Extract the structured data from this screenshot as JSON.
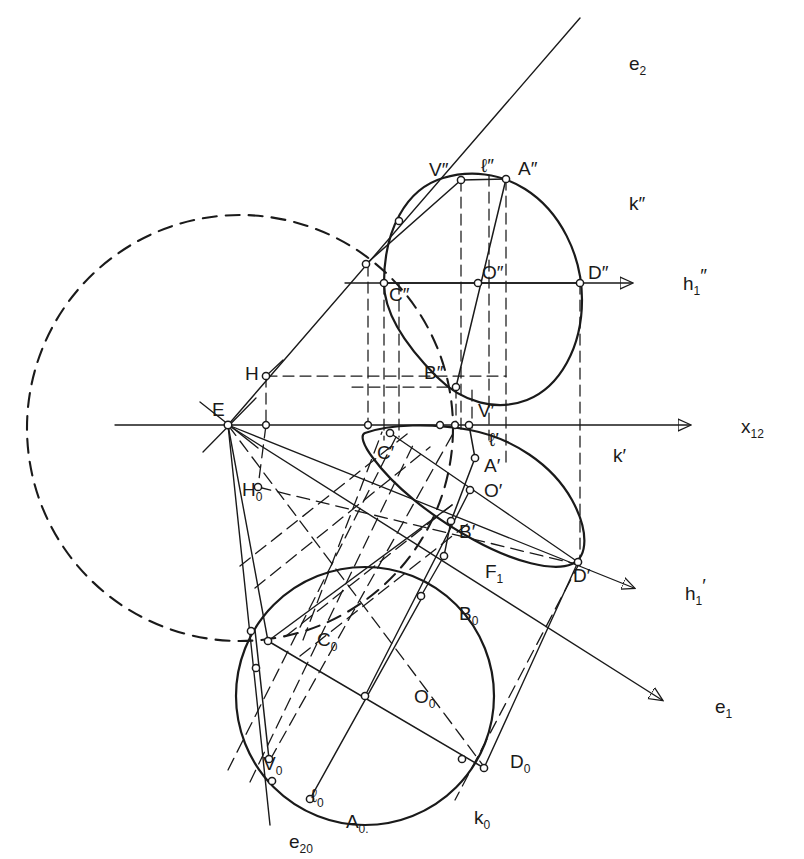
{
  "figure": {
    "background": "#ffffff",
    "ink": "#1a1a1a",
    "width": 804,
    "height": 859
  },
  "axes": [
    {
      "id": "x12",
      "label": "x",
      "sub": "12",
      "label_x": 704,
      "label_y": 426,
      "style": "solid-arrow"
    },
    {
      "id": "h1dd",
      "label": "h",
      "sub": "1",
      "sup": "″",
      "label_x": 646,
      "label_y": 283,
      "style": "solid-arrow"
    },
    {
      "id": "h1d",
      "label": "h",
      "sub": "1",
      "sup": "′",
      "label_x": 648,
      "label_y": 594,
      "style": "solid-arrow"
    },
    {
      "id": "e2",
      "label": "e",
      "sub": "2",
      "label_x": 592,
      "label_y": 64,
      "style": "solid"
    },
    {
      "id": "e1",
      "label": "e",
      "sub": "1",
      "label_x": 678,
      "label_y": 707,
      "style": "solid-arrow"
    },
    {
      "id": "e20",
      "label": "e",
      "sub": "20",
      "label_x": 258,
      "label_y": 842,
      "style": "solid"
    }
  ],
  "curves": [
    {
      "id": "k2",
      "label": "k",
      "sup": "″",
      "label_x": 592,
      "label_y": 204,
      "kind": "ellipse",
      "stroke": "solid"
    },
    {
      "id": "k1",
      "label": "k",
      "sup": "′",
      "label_x": 576,
      "label_y": 456,
      "kind": "ellipse",
      "stroke": "solid"
    },
    {
      "id": "k0",
      "label": "k",
      "sub": "0",
      "label_x": 437,
      "label_y": 818,
      "kind": "circle",
      "stroke": "solid"
    },
    {
      "id": "aux",
      "label": "",
      "kind": "circle",
      "stroke": "dashed"
    }
  ],
  "points": [
    {
      "name": "V″",
      "x": 461,
      "y": 180,
      "label_x": 429,
      "label_y": 170
    },
    {
      "name": "ℓ″",
      "x": 492,
      "y": 170,
      "label_x": 485,
      "label_y": 166,
      "no_dot": true
    },
    {
      "name": "A″",
      "x": 506,
      "y": 179,
      "label_x": 518,
      "label_y": 169
    },
    {
      "name": "C″",
      "x": 384,
      "y": 283,
      "label_x": 391,
      "label_y": 301
    },
    {
      "name": "O″",
      "x": 478,
      "y": 283,
      "label_x": 484,
      "label_y": 275
    },
    {
      "name": "D″",
      "x": 580,
      "y": 283,
      "label_x": 588,
      "label_y": 277
    },
    {
      "name": "B″",
      "x": 456,
      "y": 387,
      "label_x": 428,
      "label_y": 376
    },
    {
      "name": "H",
      "x": 266,
      "y": 376,
      "label_x": 248,
      "label_y": 372
    },
    {
      "name": "E",
      "x": 228,
      "y": 425,
      "label_x": 216,
      "label_y": 413
    },
    {
      "name": "V′",
      "x": 469,
      "y": 425,
      "label_x": 481,
      "label_y": 414
    },
    {
      "name": "ℓ′",
      "x": 489,
      "y": 433,
      "label_x": 492,
      "label_y": 440,
      "no_dot": true
    },
    {
      "name": "C′",
      "x": 390,
      "y": 433,
      "label_x": 382,
      "label_y": 457
    },
    {
      "name": "A′",
      "x": 475,
      "y": 458,
      "label_x": 487,
      "label_y": 468
    },
    {
      "name": "O′",
      "x": 470,
      "y": 490,
      "label_x": 486,
      "label_y": 492
    },
    {
      "name": "B′",
      "x": 451,
      "y": 521,
      "label_x": 462,
      "label_y": 533
    },
    {
      "name": "D′",
      "x": 578,
      "y": 562,
      "label_x": 576,
      "label_y": 578
    },
    {
      "name": "H₀",
      "x": 258,
      "y": 487,
      "label_x": 208,
      "label_y": 495
    },
    {
      "name": "F₁",
      "x": 444,
      "y": 556,
      "label_x": 451,
      "label_y": 574
    },
    {
      "name": "C₀",
      "x": 268,
      "y": 641,
      "label_x": 281,
      "label_y": 640
    },
    {
      "name": "B₀",
      "x": 421,
      "y": 596,
      "label_x": 425,
      "label_y": 616
    },
    {
      "name": "O₀",
      "x": 365,
      "y": 696,
      "label_x": 378,
      "label_y": 699
    },
    {
      "name": "D₀",
      "x": 462,
      "y": 759,
      "label_x": 474,
      "label_y": 763
    },
    {
      "name": "V₀",
      "x": 269,
      "y": 759,
      "label_x": 228,
      "label_y": 765
    },
    {
      "name": "ℓ₀",
      "x": 272,
      "y": 781,
      "label_x": 278,
      "label_y": 798,
      "no_dot": true
    },
    {
      "name": "A₀.",
      "x": 310,
      "y": 799,
      "label_x": 315,
      "label_y": 824
    }
  ],
  "notes": {
    "line_styles": [
      "solid",
      "dashed",
      "dash-dot"
    ],
    "marker": "small-open-circle"
  }
}
